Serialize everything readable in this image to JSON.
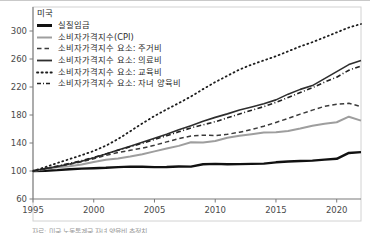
{
  "figure": {
    "title": "미국",
    "caption": "자료: 미국 노동통계국 자녀 양육비 추정치"
  },
  "chart_data": {
    "type": "line",
    "title": "미국",
    "xlabel": "",
    "ylabel": "",
    "xlim": [
      1995,
      2022
    ],
    "ylim": [
      60,
      320
    ],
    "xticks": [
      1995,
      2000,
      2005,
      2010,
      2015,
      2020
    ],
    "yticks": [
      60,
      100,
      140,
      180,
      220,
      260,
      300
    ],
    "grid": false,
    "legend_position": "upper-left",
    "index_base": "1995 = 100",
    "x": [
      1995,
      1996,
      1997,
      1998,
      1999,
      2000,
      2001,
      2002,
      2003,
      2004,
      2005,
      2006,
      2007,
      2008,
      2009,
      2010,
      2011,
      2012,
      2013,
      2014,
      2015,
      2016,
      2017,
      2018,
      2019,
      2020,
      2021,
      2022
    ],
    "series": [
      {
        "name": "실질임금",
        "style": "solid",
        "color": "#111111",
        "width": 2.4,
        "values": [
          100,
          100.4,
          101.2,
          102.6,
          103.4,
          104.0,
          104.6,
          105.6,
          106.2,
          106.0,
          105.6,
          105.8,
          106.4,
          106.2,
          109.6,
          110.2,
          109.6,
          109.8,
          110.2,
          110.6,
          112.4,
          113.6,
          114.2,
          114.8,
          116.2,
          117.4,
          125.8,
          127.0
        ]
      },
      {
        "name": "소비자가격지수(CPI)",
        "style": "solid",
        "color": "#9e9e9e",
        "width": 2.0,
        "values": [
          100,
          102.9,
          105.3,
          106.9,
          109.2,
          112.9,
          116.1,
          118.0,
          120.6,
          123.8,
          128.0,
          132.1,
          135.9,
          141.1,
          140.6,
          142.9,
          147.4,
          150.4,
          152.6,
          155.1,
          155.3,
          157.2,
          160.6,
          164.5,
          167.5,
          169.6,
          177.6,
          172.0
        ]
      },
      {
        "name": "소비자가격지수 요소: 주거비",
        "style": "dashed",
        "color": "#3a3a3a",
        "width": 1.5,
        "values": [
          100,
          103.0,
          106.2,
          109.6,
          113.2,
          117.5,
          122.2,
          126.4,
          129.5,
          132.7,
          136.8,
          141.6,
          146.2,
          150.0,
          151.2,
          150.6,
          152.4,
          155.4,
          159.2,
          164.0,
          169.4,
          175.2,
          181.2,
          187.0,
          192.4,
          195.2,
          196.8,
          192.0
        ]
      },
      {
        "name": "소비자가격지수 요소: 의료비",
        "style": "solid",
        "color": "#2e2e2e",
        "width": 1.6,
        "values": [
          100,
          103.5,
          106.4,
          109.9,
          114.0,
          118.9,
          124.3,
          130.0,
          135.4,
          141.2,
          146.8,
          152.6,
          159.0,
          164.8,
          171.0,
          176.6,
          181.6,
          187.2,
          191.4,
          196.0,
          201.6,
          209.8,
          216.6,
          222.0,
          232.0,
          242.0,
          252.0,
          258.0
        ]
      },
      {
        "name": "소비자가격지수 요소: 교육비",
        "style": "dotted",
        "color": "#1c1c1c",
        "width": 1.8,
        "values": [
          100,
          105.5,
          111.4,
          117.0,
          122.6,
          128.6,
          136.2,
          145.6,
          156.8,
          168.0,
          178.6,
          188.0,
          197.0,
          206.4,
          217.0,
          227.0,
          236.0,
          245.0,
          252.0,
          258.0,
          264.0,
          271.0,
          278.0,
          284.0,
          291.0,
          298.0,
          305.0,
          310.0
        ]
      },
      {
        "name": "소비자가격지수 요소: 자녀 양육비",
        "style": "dashdot",
        "color": "#222222",
        "width": 1.6,
        "values": [
          100,
          103.4,
          107.0,
          110.8,
          114.8,
          119.4,
          124.4,
          129.6,
          134.6,
          139.6,
          145.0,
          150.4,
          156.0,
          161.6,
          166.0,
          170.4,
          176.0,
          181.4,
          186.8,
          192.0,
          198.0,
          205.0,
          212.0,
          219.0,
          227.0,
          234.0,
          244.0,
          250.0
        ]
      }
    ]
  },
  "legend": {
    "title": "미국",
    "items": [
      {
        "label": "실질임금",
        "style": "solid-thick",
        "color": "#111111"
      },
      {
        "label": "소비자가격지수(CPI)",
        "style": "solid",
        "color": "#9e9e9e"
      },
      {
        "label": "소비자가격지수 요소: 주거비",
        "style": "dashed",
        "color": "#3a3a3a"
      },
      {
        "label": "소비자가격지수 요소: 의료비",
        "style": "solid",
        "color": "#2e2e2e"
      },
      {
        "label": "소비자가격지수 요소: 교육비",
        "style": "dotted",
        "color": "#1c1c1c"
      },
      {
        "label": "소비자가격지수 요소: 자녀 양육비",
        "style": "dashdot",
        "color": "#222222"
      }
    ]
  },
  "axes": {
    "yticklabels": [
      "300",
      "260",
      "220",
      "180",
      "140",
      "100",
      "60"
    ],
    "xticklabels": [
      "1995",
      "2000",
      "2005",
      "2010",
      "2015",
      "2020"
    ]
  }
}
